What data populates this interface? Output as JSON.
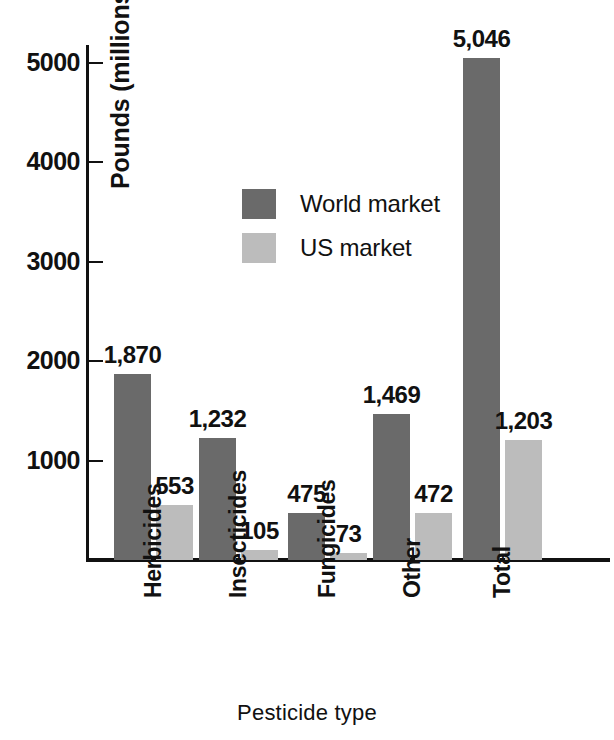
{
  "chart_data": {
    "type": "bar",
    "title": "",
    "subtitle": "",
    "xlabel": "Pesticide type",
    "ylabel": "Pounds (millions)",
    "categories": [
      "Herbicides",
      "Insecticides",
      "Fungicides",
      "Other",
      "Total"
    ],
    "series": [
      {
        "name": "World market",
        "color": "#6a6a6a",
        "values": [
          1870,
          1232,
          475,
          1469,
          5046
        ],
        "labels": [
          "1,870",
          "1,232",
          "475",
          "1,469",
          "5,046"
        ]
      },
      {
        "name": "US market",
        "color": "#bcbcbc",
        "values": [
          553,
          105,
          73,
          472,
          1203
        ],
        "labels": [
          "553",
          "105",
          "73",
          "472",
          "1,203"
        ]
      }
    ],
    "ylim": [
      0,
      5200
    ],
    "yticks": [
      1000,
      2000,
      3000,
      4000,
      5000
    ],
    "ytick_labels": [
      "1000",
      "2000",
      "3000",
      "4000",
      "5000"
    ],
    "grid": false,
    "legend_position": "upper-center-left",
    "legend": [
      {
        "label": "World market",
        "color": "#6a6a6a",
        "swatch": "legend-swatch-world"
      },
      {
        "label": "US market",
        "color": "#bcbcbc",
        "swatch": "legend-swatch-us"
      }
    ]
  },
  "axes": {
    "y_title": "Pounds (millions)",
    "x_title": "Pesticide type",
    "y_tick_labels": [
      "5000",
      "4000",
      "3000",
      "2000",
      "1000"
    ]
  },
  "colors": {
    "world_market": "#6a6a6a",
    "us_market": "#bcbcbc",
    "axis": "#111111",
    "background": "#ffffff",
    "text": "#111111"
  },
  "bars": [
    {
      "category": "Herbicides",
      "world_label": "1,870",
      "us_label": "553",
      "world_value": 1870,
      "us_value": 553
    },
    {
      "category": "Insecticides",
      "world_label": "1,232",
      "us_label": "105",
      "world_value": 1232,
      "us_value": 105
    },
    {
      "category": "Fungicides",
      "world_label": "475",
      "us_label": "73",
      "world_value": 475,
      "us_value": 73
    },
    {
      "category": "Other",
      "world_label": "1,469",
      "us_label": "472",
      "world_value": 1469,
      "us_value": 472
    },
    {
      "category": "Total",
      "world_label": "5,046",
      "us_label": "1,203",
      "world_value": 5046,
      "us_value": 1203
    }
  ]
}
